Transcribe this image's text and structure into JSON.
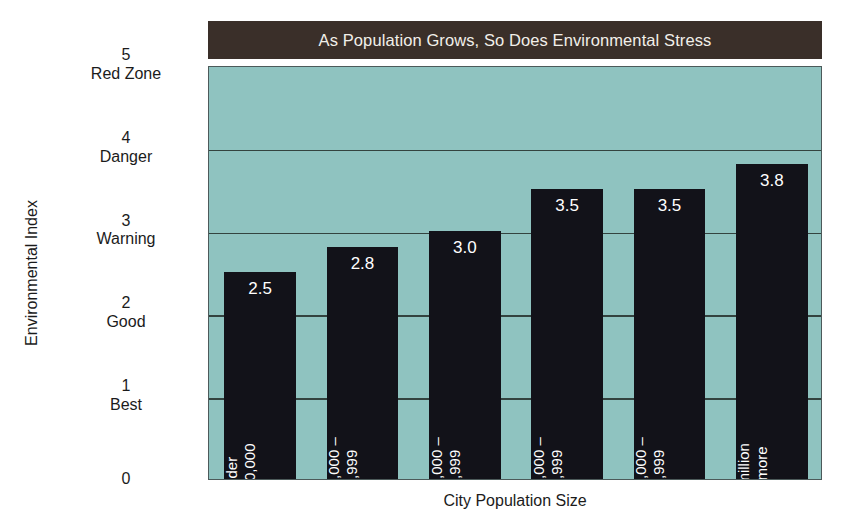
{
  "chart_data": {
    "type": "bar",
    "title": "As Population Grows, So Does Environmental Stress",
    "xlabel": "City Population Size",
    "ylabel": "Environmental Index",
    "ylim": [
      0,
      5
    ],
    "grid": true,
    "legend": "none",
    "categories": [
      "Under 100,000",
      "100,000 – 149,999",
      "150,000 – 249,999",
      "250,000 – 499,999",
      "500,000 – 999,999",
      "1 million or more"
    ],
    "values": [
      2.5,
      2.8,
      3.0,
      3.5,
      3.5,
      3.8
    ],
    "value_labels": [
      "2.5",
      "2.8",
      "3.0",
      "3.5",
      "3.5",
      "3.8"
    ],
    "yticks": [
      0,
      1,
      2,
      3,
      4,
      5
    ],
    "ytick_labels": [
      {
        "num": "0",
        "word": ""
      },
      {
        "num": "1",
        "word": "Best"
      },
      {
        "num": "2",
        "word": "Good"
      },
      {
        "num": "3",
        "word": "Warning"
      },
      {
        "num": "4",
        "word": "Danger"
      },
      {
        "num": "5",
        "word": "Red Zone"
      }
    ],
    "colors": {
      "bar": "#121219",
      "plot_background": "#8fc3c0",
      "title_banner": "#3a2f29",
      "title_text": "#f2efe9",
      "gridline": "#33433f",
      "axis_text": "#1b1b1b",
      "value_label": "#ffffff",
      "page_background": "#ffffff"
    }
  },
  "categories_split": [
    {
      "l1": "Under",
      "l2": "100,000"
    },
    {
      "l1": "100,000 –",
      "l2": "149,999"
    },
    {
      "l1": "150,000 –",
      "l2": "249,999"
    },
    {
      "l1": "250,000 –",
      "l2": "499,999"
    },
    {
      "l1": "500,000 –",
      "l2": "999,999"
    },
    {
      "l1": "1 million",
      "l2": "or more"
    }
  ]
}
